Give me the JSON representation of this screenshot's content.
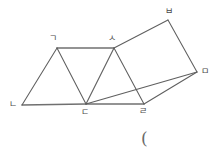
{
  "figure": {
    "type": "geometry-line-drawing",
    "background_color": "#ffffff",
    "stroke_color": "#5f5f5f",
    "label_color": "#4a4a4a",
    "width": 220,
    "height": 158,
    "vertices": [
      {
        "id": "giyeok",
        "label": "ㄱ",
        "x": 57,
        "y": 48,
        "label_x": 49,
        "label_y": 34
      },
      {
        "id": "nieun",
        "label": "ㄴ",
        "x": 22,
        "y": 105,
        "label_x": 9,
        "label_y": 100
      },
      {
        "id": "digeut",
        "label": "ㄷ",
        "x": 86,
        "y": 104,
        "label_x": 81,
        "label_y": 108
      },
      {
        "id": "rieul",
        "label": "ㄹ",
        "x": 144,
        "y": 104,
        "label_x": 139,
        "label_y": 107
      },
      {
        "id": "mieum",
        "label": "ㅁ",
        "x": 197,
        "y": 72,
        "label_x": 201,
        "label_y": 67
      },
      {
        "id": "bieup",
        "label": "ㅂ",
        "x": 168,
        "y": 20,
        "label_x": 165,
        "label_y": 7
      },
      {
        "id": "siot",
        "label": "ㅅ",
        "x": 114,
        "y": 48,
        "label_x": 108,
        "label_y": 34
      }
    ],
    "edges": [
      {
        "name": "edge-giyeok-siot",
        "from": "giyeok",
        "to": "siot",
        "emphasis": "thick"
      },
      {
        "name": "edge-nieun-digeut",
        "from": "nieun",
        "to": "digeut",
        "emphasis": "thick"
      },
      {
        "name": "edge-digeut-rieul",
        "from": "digeut",
        "to": "rieul",
        "emphasis": "thick"
      },
      {
        "name": "edge-giyeok-nieun",
        "from": "giyeok",
        "to": "nieun",
        "emphasis": "normal"
      },
      {
        "name": "edge-giyeok-digeut",
        "from": "giyeok",
        "to": "digeut",
        "emphasis": "normal"
      },
      {
        "name": "edge-siot-digeut",
        "from": "siot",
        "to": "digeut",
        "emphasis": "normal"
      },
      {
        "name": "edge-siot-rieul",
        "from": "siot",
        "to": "rieul",
        "emphasis": "normal"
      },
      {
        "name": "edge-siot-bieup",
        "from": "siot",
        "to": "bieup",
        "emphasis": "normal"
      },
      {
        "name": "edge-bieup-mieum",
        "from": "bieup",
        "to": "mieum",
        "emphasis": "normal"
      },
      {
        "name": "edge-rieul-mieum",
        "from": "rieul",
        "to": "mieum",
        "emphasis": "normal"
      },
      {
        "name": "edge-digeut-mieum",
        "from": "digeut",
        "to": "mieum",
        "emphasis": "normal"
      }
    ],
    "annotation": {
      "text": "(",
      "x": 141,
      "y": 130
    }
  }
}
